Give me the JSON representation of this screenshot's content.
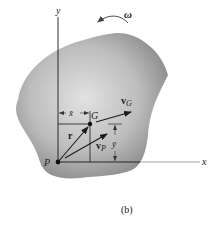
{
  "figure": {
    "caption": "(b)",
    "axes": {
      "x_label": "x",
      "y_label": "y"
    },
    "points": {
      "P": "P",
      "G": "G"
    },
    "vectors": {
      "r": "r",
      "vG": {
        "base": "v",
        "sub": "G"
      },
      "vP": {
        "base": "v",
        "sub": "P"
      }
    },
    "dimensions": {
      "xbar": "x̄",
      "ybar": "ȳ"
    },
    "angular_velocity": "ω",
    "colors": {
      "body_fill_center": "#d8d8d8",
      "body_fill_edge": "#8c8c8c",
      "line": "#1a1a1a",
      "axis_x": "#9a9a9a"
    }
  }
}
